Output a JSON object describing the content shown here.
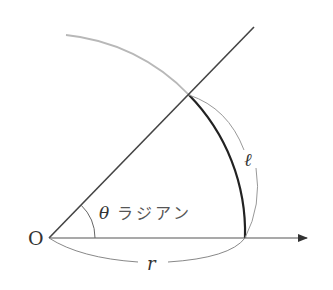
{
  "diagram": {
    "origin_label": "O",
    "angle_label_symbol": "θ",
    "angle_label_text": "ラジアン",
    "radius_label": "r",
    "arc_length_label": "ℓ",
    "colors": {
      "line": "#333333",
      "arc_highlight": "#222222",
      "circle_arc": "#b0b0b0",
      "bracket": "#888888",
      "text": "#333333"
    }
  }
}
